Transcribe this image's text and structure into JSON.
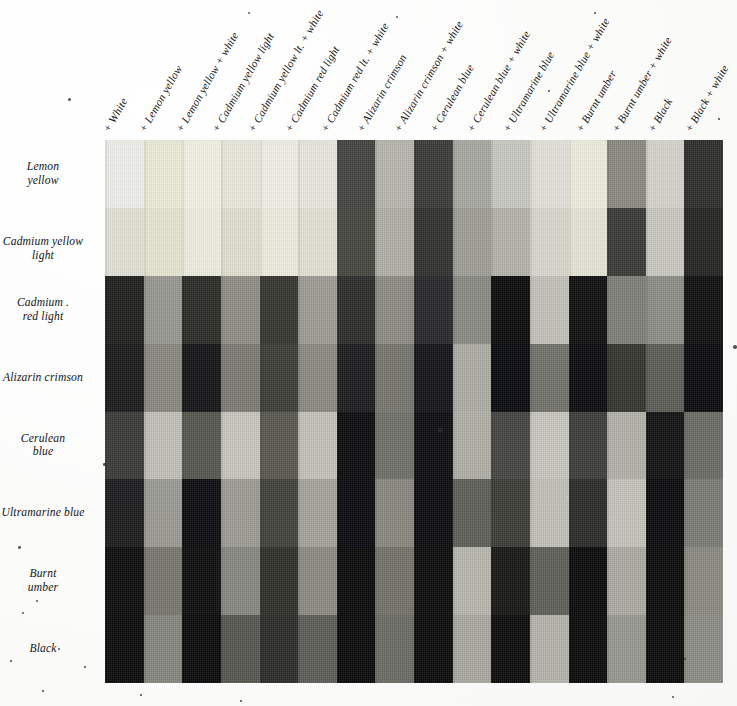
{
  "document": {
    "kind": "color-mixing-chart",
    "description": "Grayscale reproduction of a pigment mixing chart, 8 base colors crossed with 16 mixture columns",
    "background_color": "#fdfdfc",
    "grid": {
      "rows": 8,
      "columns": 16
    }
  },
  "columns": [
    {
      "label": "+ White"
    },
    {
      "label": "+ Lemon yellow"
    },
    {
      "label": "+ Lemon yellow + white"
    },
    {
      "label": "+ Cadmium yellow light"
    },
    {
      "label": "+ Cadmium yellow lt. + white"
    },
    {
      "label": "+ Cadmium red light"
    },
    {
      "label": "+ Cadmium red lt. + white"
    },
    {
      "label": "+ Alizarin crimson"
    },
    {
      "label": "+ Alizarin crimson + white"
    },
    {
      "label": "+ Cerulean blue"
    },
    {
      "label": "+ Cerulean blue + white"
    },
    {
      "label": "+ Ultramarine blue"
    },
    {
      "label": "+ Ultramarine blue + white"
    },
    {
      "label": "+ Burnt umber"
    },
    {
      "label": "+ Burnt umber + white"
    },
    {
      "label": "+ Black"
    },
    {
      "label": "+ Black + white"
    }
  ],
  "rows": [
    {
      "label": "Lemon\nyellow",
      "label_lines": [
        "Lemon",
        "yellow"
      ]
    },
    {
      "label": "Cadmium yellow light",
      "label_lines": [
        "Cadmium yellow light"
      ]
    },
    {
      "label": "Cadmium\nred light",
      "label_lines": [
        "Cadmium .",
        "red light"
      ]
    },
    {
      "label": "Alizarin crimson",
      "label_lines": [
        "Alizarin crimson"
      ]
    },
    {
      "label": "Cerulean\nblue",
      "label_lines": [
        "Cerulean",
        "blue"
      ]
    },
    {
      "label": "Ultramarine blue",
      "label_lines": [
        "Ultramarine blue"
      ]
    },
    {
      "label": "Burnt\number",
      "label_lines": [
        "Burnt",
        "umber"
      ]
    },
    {
      "label": "Black",
      "label_lines": [
        "Black"
      ]
    }
  ],
  "swatch_colors": [
    [
      "#eeeeea",
      "#ececd9",
      "#f2f2e4",
      "#e9e9de",
      "#f0f0e6",
      "#e8e8df",
      "#434340",
      "#b6b6ae",
      "#3a3a38",
      "#a8a8a2",
      "#c9c9c2",
      "#e3e3da",
      "#ededdf",
      "#8a8a82",
      "#d5d5cc",
      "#2e2e2c"
    ],
    [
      "#e2e2d6",
      "#e6e6d2",
      "#eeeee0",
      "#e0e0d0",
      "#ededdf",
      "#e2e2d6",
      "#46463f",
      "#b0b0a6",
      "#30302e",
      "#9e9e97",
      "#b4b4ac",
      "#d8d8ce",
      "#e4e4d7",
      "#3a3a36",
      "#c9c9c0",
      "#242422"
    ],
    [
      "#1f1f1e",
      "#989890",
      "#2a2a27",
      "#8e8e86",
      "#36362f",
      "#9c9c93",
      "#2c2c2a",
      "#8c8c85",
      "#28282a",
      "#8a8a84",
      "#0b0b0c",
      "#c2c2ba",
      "#0f0f10",
      "#7f7f78",
      "#8d8d86",
      "#0e0e0e"
    ],
    [
      "#1a1a1c",
      "#88887f",
      "#141416",
      "#7c7c75",
      "#3d3d37",
      "#8a8a82",
      "#1c1c1f",
      "#76766f",
      "#141418",
      "#adada4",
      "#090a10",
      "#72726b",
      "#0c0c10",
      "#34342f",
      "#5c5c56",
      "#0a0a0c"
    ],
    [
      "#3a3a37",
      "#c0c0b8",
      "#56564f",
      "#c6c6bd",
      "#57574f",
      "#c2c2b9",
      "#0b0b0d",
      "#70706a",
      "#0d0d10",
      "#b0b0a7",
      "#444440",
      "#c7c7be",
      "#3d3d3a",
      "#b2b2aa",
      "#121214",
      "#6c6c66"
    ],
    [
      "#1c1c1e",
      "#9b9b93",
      "#0c0c10",
      "#9c9c94",
      "#42423c",
      "#a4a49b",
      "#0a0a0e",
      "#88887f",
      "#0b0b0e",
      "#5f5f59",
      "#3c3c37",
      "#c1c1b8",
      "#2a2a28",
      "#c4c4bb",
      "#0a0a0c",
      "#7c7c76"
    ],
    [
      "#0c0c0c",
      "#77776f",
      "#0d0d0d",
      "#878780",
      "#2f2f2a",
      "#8b8b83",
      "#090909",
      "#737369",
      "#0b0b0b",
      "#b7b7ae",
      "#171716",
      "#5f5f59",
      "#0a0a0a",
      "#acaca3",
      "#090909",
      "#8a8a82"
    ],
    [
      "#0a0a0a",
      "#868680",
      "#090909",
      "#56564f",
      "#2b2b28",
      "#5d5d57",
      "#090909",
      "#6c6c66",
      "#0a0a0a",
      "#a9a9a1",
      "#0b0b0b",
      "#b4b4ac",
      "#0a0a0a",
      "#979790",
      "#090909",
      "#8c8c85"
    ]
  ],
  "specks": [
    {
      "x": 68,
      "y": 98,
      "size": 3.2,
      "tone": "dark"
    },
    {
      "x": 248,
      "y": 12,
      "size": 2.0,
      "tone": "dark"
    },
    {
      "x": 396,
      "y": 16,
      "size": 2.0,
      "tone": "dark"
    },
    {
      "x": 548,
      "y": 90,
      "size": 1.8,
      "tone": "dark"
    },
    {
      "x": 594,
      "y": 12,
      "size": 1.8,
      "tone": "dark"
    },
    {
      "x": 733,
      "y": 345,
      "size": 3.6,
      "tone": "dark"
    },
    {
      "x": 103,
      "y": 463,
      "size": 2.6,
      "tone": "dark"
    },
    {
      "x": 18,
      "y": 546,
      "size": 2.8,
      "tone": "dark"
    },
    {
      "x": 22,
      "y": 612,
      "size": 2.4,
      "tone": "dark"
    },
    {
      "x": 36,
      "y": 600,
      "size": 2.0,
      "tone": "dark"
    },
    {
      "x": 58,
      "y": 648,
      "size": 1.8,
      "tone": "dark"
    },
    {
      "x": 10,
      "y": 660,
      "size": 1.6,
      "tone": "dark"
    },
    {
      "x": 84,
      "y": 666,
      "size": 1.6,
      "tone": "dark"
    },
    {
      "x": 42,
      "y": 690,
      "size": 1.6,
      "tone": "dark"
    },
    {
      "x": 140,
      "y": 694,
      "size": 1.6,
      "tone": "dark"
    },
    {
      "x": 240,
      "y": 700,
      "size": 1.6,
      "tone": "dark"
    },
    {
      "x": 672,
      "y": 696,
      "size": 1.8,
      "tone": "dark"
    },
    {
      "x": 438,
      "y": 428,
      "size": 5.0,
      "tone": "dark"
    },
    {
      "x": 684,
      "y": 658,
      "size": 2.2,
      "tone": "dark"
    },
    {
      "x": 718,
      "y": 118,
      "size": 1.6,
      "tone": "dark"
    },
    {
      "x": 614,
      "y": 516,
      "size": 1.8,
      "tone": "light"
    },
    {
      "x": 566,
      "y": 496,
      "size": 1.8,
      "tone": "light"
    }
  ]
}
